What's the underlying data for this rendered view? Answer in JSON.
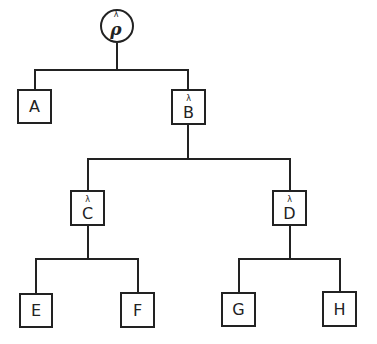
{
  "diagram": {
    "type": "tree",
    "colors": {
      "line": "#222222",
      "background": "#ffffff"
    },
    "root": {
      "id": "rho",
      "label": "ρ",
      "superscript": "λ",
      "shape": "circle"
    },
    "nodes": {
      "A": {
        "label": "A",
        "superscript": ""
      },
      "B": {
        "label": "B",
        "superscript": "λ"
      },
      "C": {
        "label": "C",
        "superscript": "λ"
      },
      "D": {
        "label": "D",
        "superscript": "λ"
      },
      "E": {
        "label": "E",
        "superscript": ""
      },
      "F": {
        "label": "F",
        "superscript": ""
      },
      "G": {
        "label": "G",
        "superscript": ""
      },
      "H": {
        "label": "H",
        "superscript": ""
      }
    },
    "edges": [
      [
        "rho",
        "A"
      ],
      [
        "rho",
        "B"
      ],
      [
        "B",
        "C"
      ],
      [
        "B",
        "D"
      ],
      [
        "C",
        "E"
      ],
      [
        "C",
        "F"
      ],
      [
        "D",
        "G"
      ],
      [
        "D",
        "H"
      ]
    ]
  }
}
